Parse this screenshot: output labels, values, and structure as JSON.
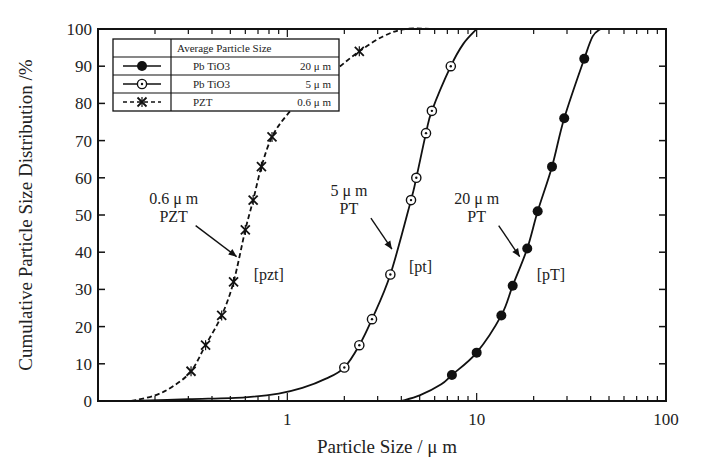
{
  "chart_data": {
    "type": "line",
    "title": "",
    "xlabel": "Particle Size / μ m",
    "ylabel": "Cumulative Particle Size Distribution /%",
    "xscale": "log",
    "xlim": [
      0.1,
      100
    ],
    "ylim": [
      0,
      100
    ],
    "xticks": [
      1,
      10,
      100
    ],
    "xtick_labels": [
      "1",
      "10",
      "100"
    ],
    "yticks": [
      0,
      10,
      20,
      30,
      40,
      50,
      60,
      70,
      80,
      90,
      100
    ],
    "ytick_labels": [
      "0",
      "10",
      "20",
      "30",
      "40",
      "50",
      "60",
      "70",
      "80",
      "90",
      "100"
    ],
    "grid": false,
    "legend": {
      "position": "upper left",
      "header": "Average Particle Size",
      "entries": [
        {
          "material": "Pb TiO3",
          "size": "20 μ m",
          "marker": "filled-circle",
          "line": "solid"
        },
        {
          "material": "Pb TiO3",
          "size": "5 μ m",
          "marker": "dotted-circle",
          "line": "solid"
        },
        {
          "material": "PZT",
          "size": "0.6 μ m",
          "marker": "x",
          "line": "dashed"
        }
      ]
    },
    "series": [
      {
        "name": "PbTiO3 20 μm",
        "marker": "filled-circle",
        "line": "solid",
        "points": [
          [
            7.4,
            7
          ],
          [
            10,
            13
          ],
          [
            13.5,
            23
          ],
          [
            15.5,
            31
          ],
          [
            18.5,
            41
          ],
          [
            21,
            51
          ],
          [
            25,
            63
          ],
          [
            29,
            76
          ],
          [
            37,
            92
          ]
        ],
        "curve": [
          [
            4.0,
            0
          ],
          [
            5.0,
            1.5
          ],
          [
            6.5,
            4.5
          ],
          [
            7.4,
            7
          ],
          [
            10,
            13
          ],
          [
            13.5,
            23
          ],
          [
            15.5,
            31
          ],
          [
            18.5,
            41
          ],
          [
            21,
            51
          ],
          [
            25,
            63
          ],
          [
            29,
            76
          ],
          [
            37,
            92
          ],
          [
            41,
            98
          ],
          [
            45,
            100
          ]
        ]
      },
      {
        "name": "PbTiO3 5 μm",
        "marker": "dotted-circle",
        "line": "solid",
        "points": [
          [
            2.0,
            9
          ],
          [
            2.4,
            15
          ],
          [
            2.8,
            22
          ],
          [
            3.5,
            34
          ],
          [
            4.5,
            54
          ],
          [
            4.8,
            60
          ],
          [
            5.4,
            72
          ],
          [
            5.8,
            78
          ],
          [
            7.3,
            90
          ]
        ],
        "curve": [
          [
            0.15,
            0
          ],
          [
            0.3,
            0.5
          ],
          [
            0.6,
            1
          ],
          [
            0.9,
            2
          ],
          [
            1.2,
            3.5
          ],
          [
            1.6,
            6
          ],
          [
            2.0,
            9
          ],
          [
            2.4,
            15
          ],
          [
            2.8,
            22
          ],
          [
            3.5,
            34
          ],
          [
            4.5,
            54
          ],
          [
            4.8,
            60
          ],
          [
            5.4,
            72
          ],
          [
            5.8,
            78
          ],
          [
            7.3,
            90
          ],
          [
            8.5,
            96
          ],
          [
            10,
            100
          ]
        ]
      },
      {
        "name": "PZT 0.6 μm",
        "marker": "x",
        "line": "dashed",
        "points": [
          [
            0.31,
            8
          ],
          [
            0.37,
            15
          ],
          [
            0.45,
            23
          ],
          [
            0.52,
            32
          ],
          [
            0.6,
            46
          ],
          [
            0.66,
            54
          ],
          [
            0.73,
            63
          ],
          [
            0.83,
            71
          ],
          [
            1.3,
            83
          ],
          [
            2.4,
            94
          ]
        ],
        "curve": [
          [
            0.15,
            0
          ],
          [
            0.2,
            1.5
          ],
          [
            0.25,
            4
          ],
          [
            0.31,
            8
          ],
          [
            0.37,
            15
          ],
          [
            0.45,
            23
          ],
          [
            0.52,
            32
          ],
          [
            0.6,
            46
          ],
          [
            0.66,
            54
          ],
          [
            0.73,
            63
          ],
          [
            0.83,
            71
          ],
          [
            1.0,
            77
          ],
          [
            1.3,
            83
          ],
          [
            1.8,
            89
          ],
          [
            2.4,
            94
          ],
          [
            3.2,
            98
          ],
          [
            4.2,
            100
          ],
          [
            6,
            100
          ]
        ]
      }
    ],
    "annotations": [
      {
        "text_lines": [
          "0.6 μ m",
          "PZT"
        ],
        "label": "[pzt]",
        "target": [
          0.56,
          38
        ]
      },
      {
        "text_lines": [
          "5 μ m",
          "PT"
        ],
        "label": "[pt]",
        "target": [
          3.7,
          40
        ]
      },
      {
        "text_lines": [
          "20 μ m",
          "PT"
        ],
        "label": "[pT]",
        "target": [
          17.5,
          38
        ]
      }
    ]
  }
}
